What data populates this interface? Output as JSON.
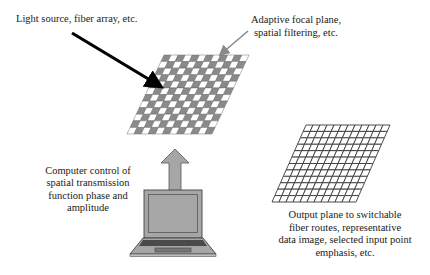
{
  "diagram": {
    "labels": {
      "light_source": "Light source, fiber array, etc.",
      "focal_plane": [
        "Adaptive focal plane,",
        "spatial filtering, etc."
      ],
      "computer": [
        "Computer control of",
        "spatial transmission",
        "function phase and",
        "amplitude"
      ],
      "output_plane": [
        "Output plane to switchable",
        "fiber routes, representative",
        "data image, selected input point",
        "emphasis, etc."
      ]
    },
    "elements": {
      "focal_plane_grid": {
        "rows": 12,
        "cols": 12,
        "pattern": "checkerboard",
        "dark_color": "#8a8a8a",
        "light_color": "#ffffff"
      },
      "output_plane_grid": {
        "rows": 12,
        "cols": 12,
        "pattern": "open-grid",
        "line_color": "#3a3a3a"
      },
      "input_arrow_color": "#000000",
      "focal_arrow_color": "#8a8a8a",
      "control_arrow_color": "#a6a6a6",
      "laptop_color": "#a6a6a6"
    }
  }
}
